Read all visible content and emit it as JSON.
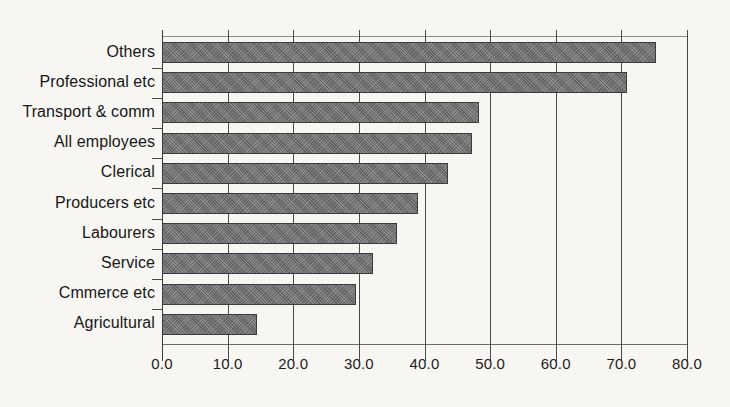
{
  "chart_data": {
    "type": "bar",
    "orientation": "horizontal",
    "title": "",
    "subtitle": "",
    "xlabel": "",
    "ylabel": "",
    "xlim": [
      0.0,
      80.0
    ],
    "xticks": [
      "0.0",
      "10.0",
      "20.0",
      "30.0",
      "40.0",
      "50.0",
      "60.0",
      "70.0",
      "80.0"
    ],
    "xtick_values": [
      0,
      10,
      20,
      30,
      40,
      50,
      60,
      70,
      80
    ],
    "grid": "vertical",
    "legend": "none",
    "categories": [
      "Others",
      "Professional etc",
      "Transport & comm",
      "All employees",
      "Clerical",
      "Producers etc",
      "Labourers",
      "Service",
      "Cmmerce etc",
      "Agricultural"
    ],
    "values": [
      75.3,
      70.9,
      48.3,
      47.3,
      43.6,
      39.0,
      35.8,
      32.2,
      29.6,
      14.5
    ],
    "bar_color": "#717171",
    "bar_edge_color": "#3c3c3c",
    "axis_color": "#4a4a4a",
    "background_color": "#f8f6f3",
    "text_color": "#161616"
  }
}
